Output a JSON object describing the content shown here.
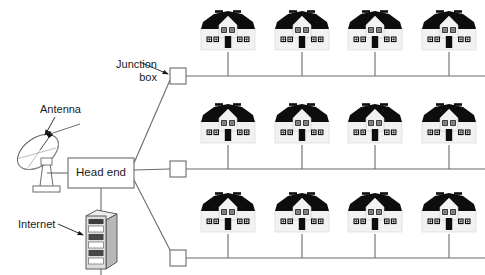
{
  "diagram": {
    "labels": {
      "junction_box": "Junction\nbox",
      "junction_box_line1": "Junction",
      "junction_box_line2": "box",
      "antenna": "Antenna",
      "internet": "Internet",
      "head_end": "Head end"
    },
    "colors": {
      "line": "#6b6b6b",
      "box_stroke": "#6b6b6b",
      "box_fill": "#ffffff",
      "roof": "#0d0d0d",
      "wall": "#f2f2f2",
      "wall_stroke": "#c8c8c8",
      "window_frame": "#111111",
      "door": "#0d0d0d",
      "text": "#1a1a1a",
      "server_body": "#d9d9d9",
      "server_stroke": "#4d4d4d",
      "background": "#ffffff"
    },
    "head_end": {
      "label": "Head end",
      "x": 68,
      "y": 158,
      "width": 66,
      "height": 30
    },
    "antenna": {
      "name": "satellite-dish",
      "x": 10,
      "y": 128
    },
    "server": {
      "name": "internet-server-rack",
      "x": 85,
      "y": 205,
      "slots": 6
    },
    "junction_boxes": [
      {
        "id": "junction-box-top",
        "x": 170,
        "y": 68,
        "size": 16
      },
      {
        "id": "junction-box-middle",
        "x": 170,
        "y": 161,
        "size": 16
      },
      {
        "id": "junction-box-bottom",
        "x": 170,
        "y": 250,
        "size": 16
      }
    ],
    "rows": [
      {
        "id": "row-top",
        "bus_y": 76,
        "bus_x_start": 186,
        "bus_x_end": 485,
        "house_base_y": 62,
        "houses": [
          {
            "id": "house-1-1",
            "cx": 228
          },
          {
            "id": "house-1-2",
            "cx": 302
          },
          {
            "id": "house-1-3",
            "cx": 375
          },
          {
            "id": "house-1-4",
            "cx": 449
          }
        ]
      },
      {
        "id": "row-middle",
        "bus_y": 169,
        "bus_x_start": 186,
        "bus_x_end": 485,
        "house_base_y": 155,
        "houses": [
          {
            "id": "house-2-1",
            "cx": 228
          },
          {
            "id": "house-2-2",
            "cx": 302
          },
          {
            "id": "house-2-3",
            "cx": 375
          },
          {
            "id": "house-2-4",
            "cx": 449
          }
        ]
      },
      {
        "id": "row-bottom",
        "bus_y": 258,
        "bus_x_start": 186,
        "bus_x_end": 485,
        "house_base_y": 244,
        "houses": [
          {
            "id": "house-3-1",
            "cx": 228
          },
          {
            "id": "house-3-2",
            "cx": 302
          },
          {
            "id": "house-3-3",
            "cx": 375
          },
          {
            "id": "house-3-4",
            "cx": 449
          }
        ]
      }
    ],
    "connections": [
      {
        "from": "antenna",
        "to": "head-end"
      },
      {
        "from": "internet-server",
        "to": "head-end"
      },
      {
        "from": "head-end",
        "to": "junction-box-top"
      },
      {
        "from": "head-end",
        "to": "junction-box-middle"
      },
      {
        "from": "head-end",
        "to": "junction-box-bottom"
      }
    ],
    "pointers": [
      {
        "id": "pointer-junction-box",
        "label": "Junction box"
      },
      {
        "id": "pointer-antenna",
        "label": "Antenna"
      },
      {
        "id": "pointer-internet",
        "label": "Internet"
      }
    ]
  }
}
